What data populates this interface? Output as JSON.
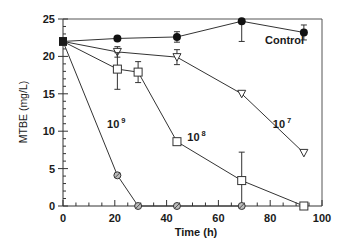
{
  "chart_data": {
    "type": "line",
    "title": "",
    "xlabel": "Time (h)",
    "ylabel": "MTBE (mg/L)",
    "xlim": [
      0,
      100
    ],
    "ylim": [
      0,
      25
    ],
    "xticks": [
      0,
      20,
      40,
      60,
      80,
      100
    ],
    "yticks": [
      0,
      5,
      10,
      15,
      20,
      25
    ],
    "x_minor_step": 5,
    "y_minor_step": 1,
    "grid": false,
    "legend": "inline labels",
    "series": [
      {
        "name": "Control",
        "label": "Control",
        "marker": "filled-circle",
        "x": [
          0,
          21,
          44,
          69,
          93
        ],
        "values": [
          22.0,
          22.4,
          22.6,
          24.7,
          23.2
        ],
        "error_low": [
          0,
          0,
          0.7,
          2.7,
          1.0
        ],
        "error_high": [
          0,
          0,
          0.7,
          0,
          1.0
        ]
      },
      {
        "name": "10^7",
        "label": "10",
        "exponent": "7",
        "marker": "open-inverted-triangle",
        "x": [
          0,
          21,
          44,
          69,
          93
        ],
        "values": [
          22.0,
          20.6,
          19.9,
          15.0,
          7.1
        ],
        "error_low": [
          0,
          0.7,
          1.0,
          0,
          0
        ],
        "error_high": [
          0,
          0.7,
          1.0,
          0,
          0
        ]
      },
      {
        "name": "10^8",
        "label": "10",
        "exponent": "8",
        "marker": "open-square",
        "x": [
          0,
          21,
          29,
          44,
          69,
          93
        ],
        "values": [
          22.0,
          18.3,
          17.9,
          8.6,
          3.4,
          0.0
        ],
        "error_low": [
          0,
          2.7,
          1.4,
          0,
          3.4,
          0
        ],
        "error_high": [
          0,
          2.2,
          1.4,
          0,
          3.8,
          0
        ]
      },
      {
        "name": "10^9",
        "label": "10",
        "exponent": "9",
        "marker": "crossed-circle",
        "x": [
          0,
          21,
          29,
          44,
          69
        ],
        "values": [
          22.0,
          4.1,
          0.0,
          0.0,
          0.0
        ],
        "error_low": [
          0,
          0,
          0,
          0,
          0
        ],
        "error_high": [
          0,
          0,
          0,
          0,
          0
        ]
      }
    ],
    "annotations": [
      {
        "text": "Control",
        "x": 78,
        "y": 21.6
      },
      {
        "text": "10^7",
        "x": 81,
        "y": 10.4
      },
      {
        "text": "10^8",
        "x": 48,
        "y": 8.7
      },
      {
        "text": "10^9",
        "x": 17,
        "y": 10.4
      }
    ]
  }
}
